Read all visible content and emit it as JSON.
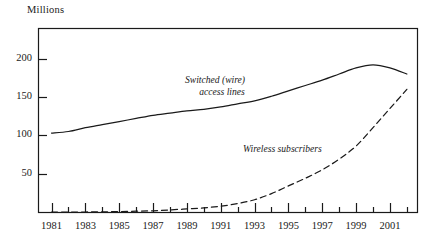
{
  "chart_data": {
    "type": "line",
    "title": "",
    "ylabel": "Millions",
    "xlabel": "",
    "ylim": [
      0,
      240
    ],
    "xlim": [
      1980.2,
      2002.6
    ],
    "grid": false,
    "legend_position": "inline-annotation",
    "y_ticks": [
      50,
      100,
      150,
      200
    ],
    "y_tick_labels": [
      "50",
      "100",
      "150",
      "200"
    ],
    "x_ticks": [
      1981,
      1982,
      1983,
      1984,
      1985,
      1986,
      1987,
      1988,
      1989,
      1990,
      1991,
      1992,
      1993,
      1994,
      1995,
      1996,
      1997,
      1998,
      1999,
      2000,
      2001,
      2002
    ],
    "x_tick_labels": [
      "1981",
      "1983",
      "1985",
      "1987",
      "1989",
      "1991",
      "1993",
      "1995",
      "1997",
      "1999",
      "2001"
    ],
    "x_labeled_ticks": [
      1981,
      1983,
      1985,
      1987,
      1989,
      1991,
      1993,
      1995,
      1997,
      1999,
      2001
    ],
    "series": [
      {
        "name": "Switched (wire) access lines",
        "style": "solid",
        "color": "#1a1a1a",
        "label_line1": "Switched (wire)",
        "label_line2": "access lines",
        "x": [
          1981,
          1982,
          1983,
          1984,
          1985,
          1986,
          1987,
          1988,
          1989,
          1990,
          1991,
          1992,
          1993,
          1994,
          1995,
          1996,
          1997,
          1998,
          1999,
          2000,
          2001,
          2002
        ],
        "values": [
          103,
          105,
          110,
          114,
          118,
          122,
          126,
          129,
          132,
          134,
          137,
          141,
          145,
          151,
          158,
          165,
          172,
          180,
          188,
          192,
          188,
          180
        ]
      },
      {
        "name": "Wireless subscribers",
        "style": "dashed",
        "color": "#1a1a1a",
        "label_line1": "Wireless subscribers",
        "x": [
          1981,
          1982,
          1983,
          1984,
          1985,
          1986,
          1987,
          1988,
          1989,
          1990,
          1991,
          1992,
          1993,
          1994,
          1995,
          1996,
          1997,
          1998,
          1999,
          2000,
          2001,
          2002
        ],
        "values": [
          0,
          0,
          0,
          0.2,
          0.5,
          1,
          1.6,
          2.7,
          4,
          5.3,
          7.6,
          11,
          16,
          24,
          34,
          44,
          55,
          69,
          86,
          110,
          135,
          160
        ]
      }
    ]
  },
  "plot": {
    "frame_color": "#1a1a1a",
    "background": "#ffffff"
  }
}
